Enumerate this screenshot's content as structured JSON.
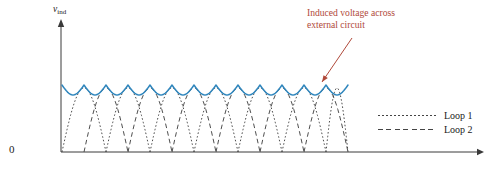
{
  "figure": {
    "background": "#ffffff",
    "axis_color": "#3a3a3a",
    "y_axis_label": "v",
    "y_axis_label_sub": "ind",
    "origin_label": "0"
  },
  "annotation": {
    "line1": "Induced voltage across",
    "line2": "external circuit",
    "color": "#b0493a",
    "leader_from_x": 352,
    "leader_from_y": 38,
    "leader_to_x": 322,
    "leader_to_y": 82
  },
  "legend": {
    "position": "right-middle",
    "entries": [
      {
        "label": "Loop 1",
        "style": "dotted",
        "color": "#444444"
      },
      {
        "label": "Loop 2",
        "style": "dashed",
        "color": "#444444"
      }
    ]
  },
  "chart_data": {
    "type": "line",
    "title": "",
    "subtitle": "",
    "xlabel": "",
    "ylabel": "v_ind",
    "xlim": [
      0,
      1
    ],
    "ylim": [
      0,
      1
    ],
    "grid": false,
    "legend_position": "right",
    "n_humps": 13,
    "hump_period_px": 22.0,
    "plot_x_start_px": 62,
    "plot_x_end_px": 348,
    "baseline_y_px": 152,
    "peak_y_px": 85,
    "trough_y_px": 95,
    "arch_top_y_px": 88,
    "annotations": [
      "Induced voltage across external circuit"
    ],
    "series": [
      {
        "name": "Induced voltage across external circuit",
        "style": "solid",
        "color": "#2f86bd",
        "description": "Scalloped envelope: sum of the two rectified loop voltages; peaks at 1.00, dips to 0.85 between humps",
        "peak_value": 1.0,
        "trough_value": 0.85,
        "n_peaks": 13
      },
      {
        "name": "Loop 1",
        "style": "dotted",
        "color": "#444444",
        "description": "Rectified sine arches, zero at baseline, peak reaches envelope level",
        "peak_value": 0.96,
        "min_value": 0.0,
        "phase_offset": 0.0,
        "n_arches": 7
      },
      {
        "name": "Loop 2",
        "style": "dashed",
        "color": "#444444",
        "description": "Rectified sine arches offset half a period from Loop 1",
        "peak_value": 0.96,
        "min_value": 0.0,
        "phase_offset": 0.5,
        "n_arches": 7
      }
    ]
  }
}
